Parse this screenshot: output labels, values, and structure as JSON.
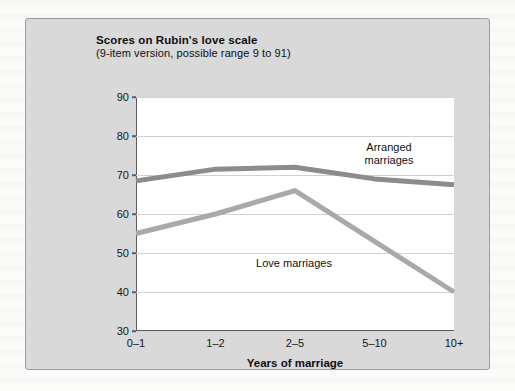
{
  "card": {
    "background_color": "#d9d9d9",
    "border_color": "#9d9d9d"
  },
  "chart_data": {
    "type": "line",
    "title": "Scores on Rubin's love scale",
    "subtitle": "(9-item version, possible range 9 to 91)",
    "xlabel": "Years of marriage",
    "ylabel": "",
    "categories": [
      "0–1",
      "1–2",
      "2–5",
      "5–10",
      "10+"
    ],
    "ylim": [
      30,
      90
    ],
    "yticks": [
      30,
      40,
      50,
      60,
      70,
      80,
      90
    ],
    "grid": true,
    "legend_position": "inline-annotations",
    "series": [
      {
        "name": "Arranged marriages",
        "label_text": "Arranged\nmarriages",
        "color": "#8c8c8c",
        "values": [
          68.5,
          71.5,
          72.0,
          69.0,
          67.5
        ]
      },
      {
        "name": "Love marriages",
        "label_text": "Love marriages",
        "color": "#a9a9a9",
        "values": [
          55.0,
          60.0,
          66.0,
          53.0,
          40.0
        ]
      }
    ]
  }
}
